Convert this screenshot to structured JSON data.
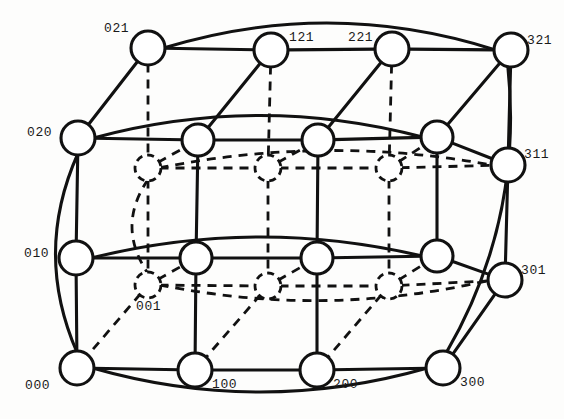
{
  "figure": {
    "name": "3-dimensional torus interconnection network diagram",
    "width": 564,
    "height": 419,
    "background_color": "#fdfdfc",
    "line_color": "#111111",
    "node_fill": "#ffffff"
  },
  "style": {
    "front_node_radius": 16,
    "mid_node_radius": 14,
    "back_node_radius": 12,
    "solid_stroke_width": 3.1,
    "dashed_stroke_width": 2.8,
    "dash_pattern": "9,7"
  },
  "nodes": [
    {
      "id": "021",
      "x": 148,
      "y": 48,
      "r": 17,
      "layer": "front",
      "style": "solid",
      "label": "021",
      "label_x": 104,
      "label_y": 22,
      "label_anchor": "start"
    },
    {
      "id": "121",
      "x": 271,
      "y": 50,
      "r": 17,
      "layer": "front",
      "style": "solid",
      "label": "121",
      "label_x": 289,
      "label_y": 31,
      "label_anchor": "start"
    },
    {
      "id": "221",
      "x": 392,
      "y": 49,
      "r": 17,
      "layer": "front",
      "style": "solid",
      "label": "221",
      "label_x": 348,
      "label_y": 31,
      "label_anchor": "start"
    },
    {
      "id": "321",
      "x": 511,
      "y": 50,
      "r": 17,
      "layer": "front",
      "style": "solid",
      "label": "321",
      "label_x": 527,
      "label_y": 34,
      "label_anchor": "start"
    },
    {
      "id": "020",
      "x": 78,
      "y": 138,
      "r": 17,
      "layer": "front",
      "style": "solid",
      "label": "020",
      "label_x": 27,
      "label_y": 126,
      "label_anchor": "start"
    },
    {
      "id": "120",
      "x": 198,
      "y": 140,
      "r": 16,
      "layer": "front",
      "style": "solid",
      "label": "",
      "label_x": 0,
      "label_y": 0,
      "label_anchor": "start"
    },
    {
      "id": "220",
      "x": 318,
      "y": 140,
      "r": 16,
      "layer": "front",
      "style": "solid",
      "label": "",
      "label_x": 0,
      "label_y": 0,
      "label_anchor": "start"
    },
    {
      "id": "320",
      "x": 437,
      "y": 137,
      "r": 16,
      "layer": "front",
      "style": "solid",
      "label": "",
      "label_x": 0,
      "label_y": 0,
      "label_anchor": "start"
    },
    {
      "id": "011",
      "x": 148,
      "y": 168,
      "r": 13,
      "layer": "back",
      "style": "dashed",
      "label": "",
      "label_x": 0,
      "label_y": 0,
      "label_anchor": "start"
    },
    {
      "id": "111",
      "x": 268,
      "y": 168,
      "r": 13,
      "layer": "back",
      "style": "dashed",
      "label": "",
      "label_x": 0,
      "label_y": 0,
      "label_anchor": "start"
    },
    {
      "id": "211",
      "x": 389,
      "y": 168,
      "r": 13,
      "layer": "back",
      "style": "dashed",
      "label": "",
      "label_x": 0,
      "label_y": 0,
      "label_anchor": "start"
    },
    {
      "id": "311",
      "x": 508,
      "y": 165,
      "r": 17,
      "layer": "front",
      "style": "solid",
      "label": "311",
      "label_x": 524,
      "label_y": 148,
      "label_anchor": "start"
    },
    {
      "id": "010",
      "x": 76,
      "y": 258,
      "r": 17,
      "layer": "front",
      "style": "solid",
      "label": "010",
      "label_x": 24,
      "label_y": 247,
      "label_anchor": "start"
    },
    {
      "id": "110",
      "x": 196,
      "y": 258,
      "r": 16,
      "layer": "front",
      "style": "solid",
      "label": "",
      "label_x": 0,
      "label_y": 0,
      "label_anchor": "start"
    },
    {
      "id": "210",
      "x": 317,
      "y": 258,
      "r": 16,
      "layer": "front",
      "style": "solid",
      "label": "",
      "label_x": 0,
      "label_y": 0,
      "label_anchor": "start"
    },
    {
      "id": "310",
      "x": 437,
      "y": 256,
      "r": 16,
      "layer": "front",
      "style": "solid",
      "label": "",
      "label_x": 0,
      "label_y": 0,
      "label_anchor": "start"
    },
    {
      "id": "001",
      "x": 148,
      "y": 285,
      "r": 13,
      "layer": "back",
      "style": "dashed",
      "label": "001",
      "label_x": 136,
      "label_y": 300,
      "label_anchor": "start"
    },
    {
      "id": "101",
      "x": 268,
      "y": 286,
      "r": 13,
      "layer": "back",
      "style": "dashed",
      "label": "",
      "label_x": 0,
      "label_y": 0,
      "label_anchor": "start"
    },
    {
      "id": "201",
      "x": 389,
      "y": 286,
      "r": 13,
      "layer": "back",
      "style": "dashed",
      "label": "",
      "label_x": 0,
      "label_y": 0,
      "label_anchor": "start"
    },
    {
      "id": "301",
      "x": 505,
      "y": 280,
      "r": 17,
      "layer": "front",
      "style": "solid",
      "label": "301",
      "label_x": 521,
      "label_y": 264,
      "label_anchor": "start"
    },
    {
      "id": "000",
      "x": 77,
      "y": 368,
      "r": 17,
      "layer": "front",
      "style": "solid",
      "label": "000",
      "label_x": 25,
      "label_y": 379,
      "label_anchor": "start"
    },
    {
      "id": "100",
      "x": 195,
      "y": 370,
      "r": 17,
      "layer": "front",
      "style": "solid",
      "label": "100",
      "label_x": 212,
      "label_y": 378,
      "label_anchor": "start"
    },
    {
      "id": "200",
      "x": 317,
      "y": 370,
      "r": 17,
      "layer": "front",
      "style": "solid",
      "label": "200",
      "label_x": 333,
      "label_y": 378,
      "label_anchor": "start"
    },
    {
      "id": "300",
      "x": 443,
      "y": 368,
      "r": 17,
      "layer": "front",
      "style": "solid",
      "label": "300",
      "label_x": 460,
      "label_y": 376,
      "label_anchor": "start"
    }
  ],
  "edges_solid": [
    {
      "from": "021",
      "to": "121"
    },
    {
      "from": "121",
      "to": "221"
    },
    {
      "from": "221",
      "to": "321"
    },
    {
      "from": "020",
      "to": "120"
    },
    {
      "from": "120",
      "to": "220"
    },
    {
      "from": "220",
      "to": "320"
    },
    {
      "from": "320",
      "to": "311"
    },
    {
      "from": "010",
      "to": "110"
    },
    {
      "from": "110",
      "to": "210"
    },
    {
      "from": "210",
      "to": "310"
    },
    {
      "from": "310",
      "to": "301"
    },
    {
      "from": "000",
      "to": "100"
    },
    {
      "from": "100",
      "to": "200"
    },
    {
      "from": "200",
      "to": "300"
    },
    {
      "from": "020",
      "to": "010"
    },
    {
      "from": "010",
      "to": "000"
    },
    {
      "from": "120",
      "to": "110"
    },
    {
      "from": "110",
      "to": "100"
    },
    {
      "from": "220",
      "to": "210"
    },
    {
      "from": "210",
      "to": "200"
    },
    {
      "from": "320",
      "to": "310"
    },
    {
      "from": "321",
      "to": "311"
    },
    {
      "from": "311",
      "to": "301"
    },
    {
      "from": "301",
      "to": "300"
    },
    {
      "from": "021",
      "to": "020"
    },
    {
      "from": "121",
      "to": "120"
    },
    {
      "from": "221",
      "to": "220"
    },
    {
      "from": "321",
      "to": "320"
    }
  ],
  "edges_dashed": [
    {
      "from": "011",
      "to": "111"
    },
    {
      "from": "111",
      "to": "211"
    },
    {
      "from": "211",
      "to": "311"
    },
    {
      "from": "001",
      "to": "101"
    },
    {
      "from": "101",
      "to": "201"
    },
    {
      "from": "201",
      "to": "301"
    },
    {
      "from": "011",
      "to": "001"
    },
    {
      "from": "111",
      "to": "101"
    },
    {
      "from": "211",
      "to": "201"
    },
    {
      "from": "021",
      "to": "011"
    },
    {
      "from": "121",
      "to": "111"
    },
    {
      "from": "221",
      "to": "211"
    },
    {
      "from": "001",
      "to": "000"
    },
    {
      "from": "101",
      "to": "100"
    },
    {
      "from": "201",
      "to": "200"
    },
    {
      "from": "011",
      "to": "120"
    },
    {
      "from": "111",
      "to": "220"
    },
    {
      "from": "211",
      "to": "320"
    },
    {
      "from": "001",
      "to": "110"
    },
    {
      "from": "101",
      "to": "210"
    },
    {
      "from": "201",
      "to": "310"
    }
  ],
  "curved_edges": [
    {
      "name": "wrap-top-021-321",
      "from": "021",
      "to": "321",
      "bow": -26,
      "style": "solid"
    },
    {
      "name": "wrap-row020",
      "from": "020",
      "to": "320",
      "bow": -22,
      "style": "solid"
    },
    {
      "name": "wrap-row010",
      "from": "010",
      "to": "310",
      "bow": -20,
      "style": "solid"
    },
    {
      "name": "wrap-bottom-000",
      "from": "000",
      "to": "300",
      "bow": 24,
      "style": "solid"
    },
    {
      "name": "wrap-left-020-000",
      "from": "020",
      "to": "000",
      "bow": 22,
      "style": "solid"
    },
    {
      "name": "wrap-right-321-300",
      "from": "321",
      "to": "300",
      "bow": -24,
      "style": "solid"
    },
    {
      "name": "wrap-back-row011",
      "from": "011",
      "to": "311",
      "bow": -16,
      "style": "dashed"
    },
    {
      "name": "wrap-back-row001",
      "from": "001",
      "to": "301",
      "bow": 18,
      "style": "dashed"
    },
    {
      "name": "wrap-back-left",
      "from": "011",
      "to": "001",
      "bow": 16,
      "style": "dashed"
    }
  ],
  "labels_list": [
    "021",
    "121",
    "221",
    "321",
    "020",
    "311",
    "010",
    "001",
    "301",
    "000",
    "100",
    "200",
    "300"
  ]
}
